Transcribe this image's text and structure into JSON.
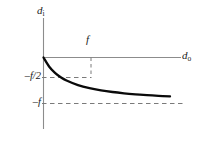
{
  "figure": {
    "background_color": "#ffffff",
    "axis_color": "#8c8c8c",
    "curve_color": "#0a0a0a",
    "dashed_color": "#7a7a7a",
    "text_color": "#1a1a1a"
  },
  "labels": {
    "y_axis": "d",
    "y_axis_sub": "i",
    "x_axis": "d",
    "x_axis_sub": "o",
    "focal_tick": "f",
    "neg_f_half": "–f/2",
    "neg_f": "–f"
  },
  "chart_data": {
    "type": "line",
    "title": "",
    "xlabel": "d_o",
    "ylabel": "d_i",
    "grid": false,
    "legend": null,
    "xlim": [
      0,
      6
    ],
    "ylim": [
      -1.25,
      0.55
    ],
    "xticks": [
      1
    ],
    "xticklabels": [
      "f"
    ],
    "yticks": [
      -0.5,
      -1
    ],
    "yticklabels": [
      "–f/2",
      "–f"
    ],
    "annotations": [
      {
        "text": "f",
        "x": 1,
        "y": 0.35,
        "note": "focal-distance tick label above axis"
      },
      {
        "text": "–f/2",
        "x": 0,
        "y": -0.5,
        "note": "image distance when object at focal length"
      },
      {
        "text": "–f",
        "x": 0,
        "y": -1,
        "note": "horizontal asymptote of the curve"
      }
    ],
    "dashed_guides": [
      {
        "orientation": "vertical",
        "x": 1,
        "y_from": 0,
        "y_to": -0.5
      },
      {
        "orientation": "horizontal",
        "y": -0.5,
        "x_from": 0,
        "x_to": 1
      },
      {
        "orientation": "horizontal",
        "y": -1,
        "x_from": 0,
        "x_to": 6
      }
    ],
    "series": [
      {
        "name": "d_i = -f·d_o/(d_o + f)",
        "x": [
          0,
          0.25,
          0.5,
          0.75,
          1,
          1.5,
          2,
          2.5,
          3,
          3.5,
          4,
          4.5,
          5,
          5.5,
          6
        ],
        "y": [
          0,
          -0.2,
          -0.333,
          -0.429,
          -0.5,
          -0.6,
          -0.667,
          -0.714,
          -0.75,
          -0.778,
          -0.8,
          -0.818,
          -0.833,
          -0.846,
          -0.857
        ]
      }
    ]
  }
}
